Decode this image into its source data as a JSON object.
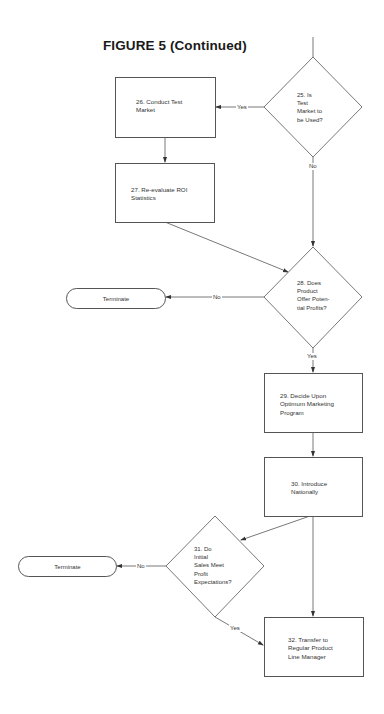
{
  "figure": {
    "title": "FIGURE 5 (Continued)"
  },
  "nodes": {
    "n25": {
      "type": "decision",
      "text": "25. Is\nTest\nMarket to\nbe Used?"
    },
    "n26": {
      "type": "process",
      "text": "26. Conduct Test\nMarket"
    },
    "n27": {
      "type": "process",
      "text": "27. Re-evaluate ROI\nStatistics"
    },
    "n28": {
      "type": "decision",
      "text": "28. Does\nProduct\nOffer Poten-\ntial Profits?"
    },
    "t1": {
      "type": "terminal",
      "text": "Terminate"
    },
    "n29": {
      "type": "process",
      "text": "29. Decide Upon\nOptimum Marketing\nProgram"
    },
    "n30": {
      "type": "process",
      "text": "30. Introduce\nNationally"
    },
    "n31": {
      "type": "decision",
      "text": "31. Do\nInitial\nSales Meet\nProfit\nExpectations?"
    },
    "t2": {
      "type": "terminal",
      "text": "Terminate"
    },
    "n32": {
      "type": "process",
      "text": "32. Transfer to\nRegular Product\nLine Manager"
    }
  },
  "edges": {
    "e25_26": {
      "from": "25",
      "to": "26",
      "label": "Yes"
    },
    "e25_28": {
      "from": "25",
      "to": "28",
      "label": "No"
    },
    "e26_27": {
      "from": "26",
      "to": "27",
      "label": ""
    },
    "e27_28": {
      "from": "27",
      "to": "28",
      "label": ""
    },
    "e28_t1": {
      "from": "28",
      "to": "Terminate",
      "label": "No"
    },
    "e28_29": {
      "from": "28",
      "to": "29",
      "label": "Yes"
    },
    "e29_30": {
      "from": "29",
      "to": "30",
      "label": ""
    },
    "e30_31": {
      "from": "30",
      "to": "31",
      "label": ""
    },
    "e30_32": {
      "from": "30",
      "to": "32",
      "label": ""
    },
    "e31_t2": {
      "from": "31",
      "to": "Terminate",
      "label": "No"
    },
    "e31_32": {
      "from": "31",
      "to": "32",
      "label": "Yes"
    }
  },
  "colors": {
    "line": "#555555",
    "text": "#333333",
    "background": "#ffffff"
  }
}
